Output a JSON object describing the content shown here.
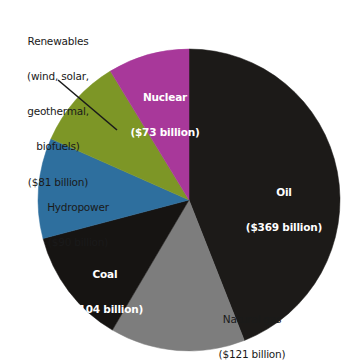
{
  "chart_data": {
    "type": "pie",
    "title": "",
    "subtitle": "",
    "unit": "billion US dollars",
    "total": 838,
    "start_angle_deg": 0,
    "direction": "clockwise",
    "legend": "none (labels placed on slices)",
    "categories": [
      "Oil",
      "Natural gas",
      "Coal",
      "Hydropower",
      "Renewables (wind, solar, geothermal, biofuels)",
      "Nuclear"
    ],
    "values": [
      369,
      121,
      104,
      90,
      81,
      73
    ],
    "labels": [
      "($369 billion)",
      "($121 billion)",
      "($104 billion)",
      "($90 billion)",
      "($81 billion)",
      "($73 billion)"
    ],
    "colors": [
      "#1c1a18",
      "#7d7d7d",
      "#161412",
      "#2e6f9e",
      "#7d9626",
      "#a8389a"
    ],
    "slices": [
      {
        "name": "Oil",
        "value": 369,
        "label_line1": "Oil",
        "label_line2": "($369 billion)",
        "color": "#1c1a18",
        "start_deg": 0,
        "end_deg": 158.5,
        "label_placement": "inside",
        "label_style": "white-bold"
      },
      {
        "name": "Natural gas",
        "value": 121,
        "label_line1": "Natural gas",
        "label_line2": "($121 billion)",
        "color": "#7d7d7d",
        "start_deg": 158.5,
        "end_deg": 210.5,
        "label_placement": "inside",
        "label_style": "dark-regular"
      },
      {
        "name": "Coal",
        "value": 104,
        "label_line1": "Coal",
        "label_line2": "($104 billion)",
        "color": "#161412",
        "start_deg": 210.5,
        "end_deg": 255.2,
        "label_placement": "inside",
        "label_style": "white-bold"
      },
      {
        "name": "Hydropower",
        "value": 90,
        "label_line1": "Hydropower",
        "label_line2": "($90 billion)",
        "color": "#2e6f9e",
        "start_deg": 255.2,
        "end_deg": 293.9,
        "label_placement": "inside",
        "label_style": "dark-regular"
      },
      {
        "name": "Renewables",
        "value": 81,
        "label_line1": "Renewables",
        "label_line2": "(wind, solar,",
        "label_line3": "geothermal,",
        "label_line4": "biofuels)",
        "label_line5": "($81 billion)",
        "color": "#7d9626",
        "start_deg": 293.9,
        "end_deg": 328.6,
        "label_placement": "outside-with-leader-line",
        "label_style": "dark-regular"
      },
      {
        "name": "Nuclear",
        "value": 73,
        "label_line1": "Nuclear",
        "label_line2": "($73 billion)",
        "color": "#a8389a",
        "start_deg": 328.6,
        "end_deg": 360,
        "label_placement": "inside",
        "label_style": "white-bold"
      }
    ]
  },
  "geometry": {
    "center_x": 189,
    "center_y": 200,
    "radius": 151
  }
}
